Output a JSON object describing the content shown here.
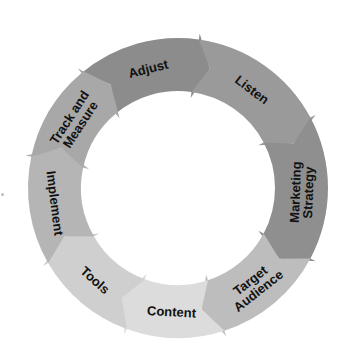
{
  "diagram": {
    "type": "cycle",
    "direction": "clockwise",
    "center": [
      178,
      188
    ],
    "outer_radius": 150,
    "inner_radius": 97,
    "steps": [
      {
        "label": "Adjust",
        "lines": [
          "Adjust"
        ],
        "start": -40,
        "end": 8,
        "color": "#8c8c8c"
      },
      {
        "label": "Listen",
        "lines": [
          "Listen"
        ],
        "start": 8,
        "end": 62,
        "color": "#9a9a9a"
      },
      {
        "label": "Marketing Strategy",
        "lines": [
          "Marketing",
          "Strategy"
        ],
        "start": 62,
        "end": 118,
        "color": "#8f8f8f"
      },
      {
        "label": "Target Audience",
        "lines": [
          "Target",
          "Audience"
        ],
        "start": 118,
        "end": 162,
        "color": "#bdbdbd"
      },
      {
        "label": "Content",
        "lines": [
          "Content"
        ],
        "start": 162,
        "end": 200,
        "color": "#dcdcdc"
      },
      {
        "label": "Tools",
        "lines": [
          "Tools"
        ],
        "start": 200,
        "end": 240,
        "color": "#cfcfcf"
      },
      {
        "label": "Implement",
        "lines": [
          "Implement"
        ],
        "start": 240,
        "end": 282,
        "color": "#b5b5b5"
      },
      {
        "label": "Track and Measure",
        "lines": [
          "Track and",
          "Measure"
        ],
        "start": 282,
        "end": 320,
        "color": "#a8a8a8"
      }
    ]
  }
}
